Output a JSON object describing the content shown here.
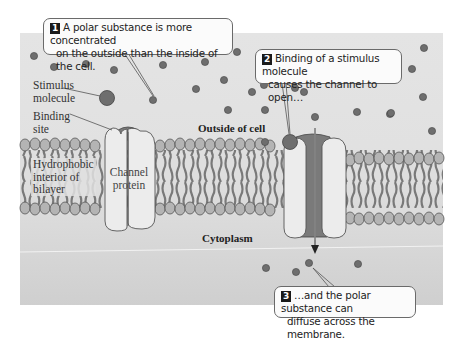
{
  "figure": {
    "colors": {
      "panel_top": "#e2e2e2",
      "panel_bottom": "#d0d0d0",
      "lipid_head": "#b4b4b4",
      "lipid_tail": "#5a5a5a",
      "channel_protein": "#ececec",
      "channel_pore": "#7a7a7a",
      "molecule": "#6e6e6e",
      "badge": "#1a1a1a"
    }
  },
  "callouts": [
    {
      "number": "1",
      "line1": "A polar substance is more concentrated",
      "line2": "on the outside than the inside of the cell."
    },
    {
      "number": "2",
      "line1": "Binding of a stimulus molecule",
      "line2": "causes the channel to open…"
    },
    {
      "number": "3",
      "line1": "…and the polar substance can",
      "line2": "diffuse across the membrane."
    }
  ],
  "labels": {
    "stimulus_molecule": {
      "line1": "Stimulus",
      "line2": "molecule"
    },
    "binding_site": {
      "line1": "Binding",
      "line2": "site"
    },
    "hydrophobic": {
      "line1": "Hydrophobic",
      "line2": "interior of",
      "line3": "bilayer"
    },
    "channel_protein": {
      "line1": "Channel",
      "line2": "protein"
    },
    "outside_of_cell": "Outside of cell",
    "cytoplasm": "Cytoplasm"
  }
}
